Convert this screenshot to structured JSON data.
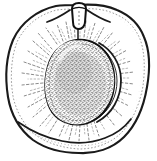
{
  "image": {
    "title": "Halved apricot line engraving",
    "subject": "apricot-fruit-cross-section",
    "style": "black-and-white stipple line engraving",
    "alt_text": "Black and white engraved illustration of an apricot cut in half showing the large stippled pit in the center and radiating flesh fibers",
    "background_color": "#ffffff",
    "ink_color": "#1a1a1a",
    "stipple_color": "#3a3a3a",
    "canvas": {
      "width": 157,
      "height": 161
    }
  },
  "parts": {
    "fruit_outline": {
      "label": "Fruit outer skin outline",
      "description": "Large rounded outline of the halved fruit spanning nearly the full frame"
    },
    "fruit_inner_rim": {
      "label": "Inner skin rim line",
      "description": "Thin second line just inside the skin outline"
    },
    "flesh": {
      "label": "Flesh",
      "description": "White flesh area between skin and pit with fine radiating fibers"
    },
    "radiating_fibers": {
      "label": "Radiating flesh fibers",
      "description": "Short dashed rays emanating outward from the pit toward the skin",
      "count": 72
    },
    "pit": {
      "label": "Pit (stone)",
      "description": "Large central oval stone rendered with dense stipple texture"
    },
    "pit_outline": {
      "label": "Pit outline",
      "description": "Heavy dark contour around the stone"
    },
    "pit_ridge": {
      "label": "Pit side ridge",
      "description": "Crescent ridge line along the right side of the stone"
    },
    "stem": {
      "label": "Stem",
      "description": "Short woody stem stub at the top center of the fruit"
    },
    "stem_cleft": {
      "label": "Stem cleft",
      "description": "Shallow V shaped depressions flanking the stem"
    },
    "suture_line": {
      "label": "Suture groove",
      "description": "Short vertical line running from stem down to the pit"
    }
  }
}
